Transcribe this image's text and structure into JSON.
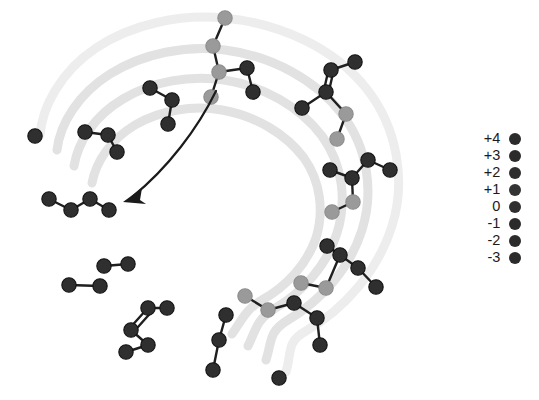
{
  "figure": {
    "title": "",
    "type": "spiral-network-diagram",
    "background": "#ffffff",
    "spiral": {
      "band_color": "#e2e2e2",
      "band_color_outer": "#ededed",
      "band_width": 9,
      "turns": 4,
      "center_x": 213,
      "center_y": 197,
      "description": "four concentric light gray spiral bands"
    },
    "arrow": {
      "color": "#1b1b1b",
      "start_x": 216,
      "start_y": 91,
      "end_x": 124,
      "end_y": 200,
      "label": ""
    },
    "node_colors": {
      "dark": "#2f2f2f",
      "mid": "#3a3a3a",
      "light": "#9a9a9a",
      "lighter": "#a8a8a8"
    },
    "edge_color": "#1f1f1f"
  },
  "legend": {
    "title": "",
    "items": [
      {
        "label": "+4",
        "color": "#2b2b2b"
      },
      {
        "label": "+3",
        "color": "#2b2b2b"
      },
      {
        "label": "+2",
        "color": "#2f2f2f"
      },
      {
        "label": "+1",
        "color": "#333333"
      },
      {
        "label": "0",
        "color": "#2f2f2f"
      },
      {
        "label": "-1",
        "color": "#2b2b2b"
      },
      {
        "label": "-2",
        "color": "#2b2b2b"
      },
      {
        "label": "-3",
        "color": "#2b2b2b"
      }
    ]
  },
  "chart_data": {
    "type": "scatter",
    "title": "",
    "xlabel": "",
    "ylabel": "",
    "legend_position": "right",
    "grid": false,
    "nodes": [
      {
        "x": 225,
        "y": 18,
        "shade": "light"
      },
      {
        "x": 213,
        "y": 46,
        "shade": "light"
      },
      {
        "x": 219,
        "y": 72,
        "shade": "light"
      },
      {
        "x": 211,
        "y": 97,
        "shade": "light"
      },
      {
        "x": 247,
        "y": 68,
        "shade": "dark"
      },
      {
        "x": 253,
        "y": 92,
        "shade": "dark"
      },
      {
        "x": 331,
        "y": 70,
        "shade": "dark"
      },
      {
        "x": 355,
        "y": 62,
        "shade": "dark"
      },
      {
        "x": 326,
        "y": 92,
        "shade": "dark"
      },
      {
        "x": 302,
        "y": 108,
        "shade": "dark"
      },
      {
        "x": 346,
        "y": 114,
        "shade": "light"
      },
      {
        "x": 337,
        "y": 139,
        "shade": "light"
      },
      {
        "x": 150,
        "y": 88,
        "shade": "dark"
      },
      {
        "x": 172,
        "y": 100,
        "shade": "dark"
      },
      {
        "x": 168,
        "y": 124,
        "shade": "dark"
      },
      {
        "x": 35,
        "y": 136,
        "shade": "dark"
      },
      {
        "x": 85,
        "y": 132,
        "shade": "dark"
      },
      {
        "x": 108,
        "y": 135,
        "shade": "dark"
      },
      {
        "x": 117,
        "y": 152,
        "shade": "dark"
      },
      {
        "x": 330,
        "y": 170,
        "shade": "dark"
      },
      {
        "x": 368,
        "y": 160,
        "shade": "dark"
      },
      {
        "x": 390,
        "y": 170,
        "shade": "dark"
      },
      {
        "x": 352,
        "y": 178,
        "shade": "dark"
      },
      {
        "x": 353,
        "y": 202,
        "shade": "light"
      },
      {
        "x": 332,
        "y": 212,
        "shade": "light"
      },
      {
        "x": 49,
        "y": 199,
        "shade": "dark"
      },
      {
        "x": 71,
        "y": 210,
        "shade": "dark"
      },
      {
        "x": 90,
        "y": 199,
        "shade": "dark"
      },
      {
        "x": 109,
        "y": 210,
        "shade": "dark"
      },
      {
        "x": 327,
        "y": 246,
        "shade": "dark"
      },
      {
        "x": 104,
        "y": 266,
        "shade": "dark"
      },
      {
        "x": 128,
        "y": 264,
        "shade": "dark"
      },
      {
        "x": 100,
        "y": 286,
        "shade": "dark"
      },
      {
        "x": 69,
        "y": 285,
        "shade": "dark"
      },
      {
        "x": 340,
        "y": 255,
        "shade": "dark"
      },
      {
        "x": 358,
        "y": 268,
        "shade": "dark"
      },
      {
        "x": 301,
        "y": 283,
        "shade": "light"
      },
      {
        "x": 326,
        "y": 288,
        "shade": "light"
      },
      {
        "x": 376,
        "y": 287,
        "shade": "dark"
      },
      {
        "x": 167,
        "y": 308,
        "shade": "dark"
      },
      {
        "x": 148,
        "y": 308,
        "shade": "dark"
      },
      {
        "x": 131,
        "y": 330,
        "shade": "dark"
      },
      {
        "x": 148,
        "y": 345,
        "shade": "dark"
      },
      {
        "x": 126,
        "y": 352,
        "shade": "dark"
      },
      {
        "x": 245,
        "y": 296,
        "shade": "light"
      },
      {
        "x": 268,
        "y": 310,
        "shade": "light"
      },
      {
        "x": 226,
        "y": 315,
        "shade": "dark"
      },
      {
        "x": 219,
        "y": 340,
        "shade": "dark"
      },
      {
        "x": 213,
        "y": 370,
        "shade": "dark"
      },
      {
        "x": 294,
        "y": 303,
        "shade": "dark"
      },
      {
        "x": 317,
        "y": 318,
        "shade": "dark"
      },
      {
        "x": 320,
        "y": 345,
        "shade": "dark"
      },
      {
        "x": 279,
        "y": 378,
        "shade": "dark"
      }
    ]
  }
}
